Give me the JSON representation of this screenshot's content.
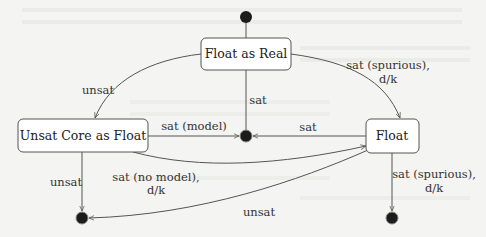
{
  "diagram": {
    "type": "state-machine",
    "states": [
      {
        "id": "float_as_real",
        "label": "Float as Real"
      },
      {
        "id": "unsat_core_as_float",
        "label": "Unsat Core as Float"
      },
      {
        "id": "float",
        "label": "Float"
      }
    ],
    "pseudo_states": [
      {
        "id": "initial",
        "kind": "initial"
      },
      {
        "id": "final_middle",
        "kind": "final"
      },
      {
        "id": "final_left",
        "kind": "final"
      },
      {
        "id": "final_right",
        "kind": "final"
      }
    ],
    "transitions": [
      {
        "from": "initial",
        "to": "float_as_real",
        "label": ""
      },
      {
        "from": "float_as_real",
        "to": "unsat_core_as_float",
        "label": "unsat"
      },
      {
        "from": "float_as_real",
        "to": "final_middle",
        "label": "sat"
      },
      {
        "from": "float_as_real",
        "to": "float",
        "label_line1": "sat (spurious),",
        "label_line2": "d/k"
      },
      {
        "from": "unsat_core_as_float",
        "to": "final_middle",
        "label": "sat (model)"
      },
      {
        "from": "float",
        "to": "final_middle",
        "label": "sat"
      },
      {
        "from": "unsat_core_as_float",
        "to": "float",
        "label_line1": "sat (no model),",
        "label_line2": "d/k"
      },
      {
        "from": "unsat_core_as_float",
        "to": "final_left",
        "label": "unsat"
      },
      {
        "from": "float",
        "to": "final_left",
        "label": "unsat"
      },
      {
        "from": "float",
        "to": "final_right",
        "label_line1": "sat (spurious),",
        "label_line2": "d/k"
      }
    ]
  },
  "labels": {
    "float_as_real": "Float as Real",
    "unsat_core_as_float": "Unsat Core as Float",
    "float": "Float",
    "t_far_unsat": "unsat",
    "t_far_sat": "sat",
    "t_far_spurious_1": "sat (spurious),",
    "t_far_spurious_2": "d/k",
    "t_ucf_model": "sat (model)",
    "t_float_sat": "sat",
    "t_ucf_nomodel_1": "sat (no model),",
    "t_ucf_nomodel_2": "d/k",
    "t_ucf_unsat": "unsat",
    "t_float_unsat": "unsat",
    "t_float_spurious_1": "sat (spurious),",
    "t_float_spurious_2": "d/k"
  }
}
